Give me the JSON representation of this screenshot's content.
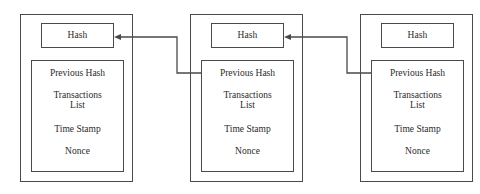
{
  "diagram": {
    "stroke_color": "#4a4a4a",
    "text_color": "#2a2a2a",
    "background": "#ffffff",
    "blocks": [
      {
        "id": "block-1",
        "hash_label": "Hash",
        "fields": {
          "previous_hash": "Previous Hash",
          "transactions_line1": "Transactions",
          "transactions_line2": "List",
          "time_stamp": "Time Stamp",
          "nonce": "Nonce"
        }
      },
      {
        "id": "block-2",
        "hash_label": "Hash",
        "fields": {
          "previous_hash": "Previous Hash",
          "transactions_line1": "Transactions",
          "transactions_line2": "List",
          "time_stamp": "Time Stamp",
          "nonce": "Nonce"
        }
      },
      {
        "id": "block-3",
        "hash_label": "Hash",
        "fields": {
          "previous_hash": "Previous Hash",
          "transactions_line1": "Transactions",
          "transactions_line2": "List",
          "time_stamp": "Time Stamp",
          "nonce": "Nonce"
        }
      }
    ],
    "connectors": [
      {
        "id": "connector-block2-to-block1",
        "from": "block-2 Previous Hash",
        "to": "block-1 Hash",
        "direction": "left"
      },
      {
        "id": "connector-block3-to-block2",
        "from": "block-3 Previous Hash",
        "to": "block-2 Hash",
        "direction": "left"
      }
    ]
  }
}
